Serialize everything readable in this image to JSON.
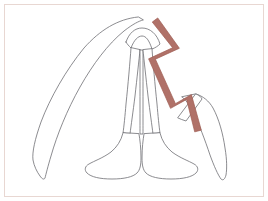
{
  "figure": {
    "title": "Line-art outline diagram with highlighted zigzag path",
    "type": "diagram",
    "canvas": {
      "width": 268,
      "height": 201
    },
    "background_color": "#ffffff",
    "border": {
      "color": "#e8d7d2",
      "width_px": 1,
      "inset_px": 4,
      "label": "figure-border"
    },
    "styles": {
      "outline_stroke_color": "#6e6e73",
      "outline_stroke_width": 0.8,
      "outline_fill_color": "#ffffff",
      "highlight_stroke_color": "#9d5a50",
      "highlight_fill_color": "#b07168",
      "highlight_stroke_width": 0.7
    },
    "parts": [
      {
        "name": "left-curved-blade",
        "description": "Long tapered blade curving from the central apex down and to the left, ending in a fine point near the lower left.",
        "stroke": "#6e6e73",
        "fill": "#ffffff"
      },
      {
        "name": "central-arch",
        "description": "Rounded arch at the top spanning the two central columns.",
        "stroke": "#6e6e73",
        "fill": "#ffffff"
      },
      {
        "name": "central-column-left",
        "description": "Thin vertical column descending from the arch to the left foot.",
        "stroke": "#6e6e73",
        "fill": "#ffffff"
      },
      {
        "name": "central-column-right",
        "description": "Thin vertical column descending from the arch to the right foot.",
        "stroke": "#6e6e73",
        "fill": "#ffffff"
      },
      {
        "name": "central-column-divider",
        "description": "Narrow sliver separating the two central columns.",
        "stroke": "#6e6e73",
        "fill": "#ffffff"
      },
      {
        "name": "foot-left",
        "description": "Flared foot shape at the base of the left central column.",
        "stroke": "#6e6e73",
        "fill": "#ffffff"
      },
      {
        "name": "foot-right",
        "description": "Flared foot shape at the base of the right central column.",
        "stroke": "#6e6e73",
        "fill": "#ffffff"
      },
      {
        "name": "right-curved-blade",
        "description": "Long tapered blade curving from the mid-right down to a point at the lower right.",
        "stroke": "#6e6e73",
        "fill": "#ffffff"
      },
      {
        "name": "right-upper-wedge",
        "description": "Small angular wedge at the upper end of the right blade.",
        "stroke": "#6e6e73",
        "fill": "#ffffff"
      },
      {
        "name": "highlight-zigzag-path",
        "description": "Reddish-brown zigzag band running from the upper apex down the right side to a point at the lower right.",
        "stroke": "#9d5a50",
        "fill": "#b07168",
        "vertices": [
          [
            155,
            20
          ],
          [
            176,
            48
          ],
          [
            152,
            59
          ],
          [
            173,
            106
          ],
          [
            189,
            97
          ],
          [
            198,
            131
          ]
        ]
      }
    ]
  }
}
